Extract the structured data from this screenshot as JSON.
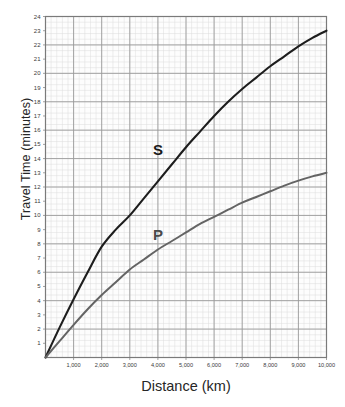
{
  "chart_data": {
    "type": "line",
    "title": "",
    "xlabel": "Distance (km)",
    "ylabel": "Travel Time (minutes)",
    "xlim": [
      0,
      10000
    ],
    "ylim": [
      0,
      24
    ],
    "grid": true,
    "grid_major_x_step": 1000,
    "grid_major_y_step": 2,
    "grid_minor_x_step": 200,
    "grid_minor_y_step": 0.4,
    "legend": "inline-labels",
    "xticks": [
      1000,
      2000,
      3000,
      4000,
      5000,
      6000,
      7000,
      8000,
      9000,
      10000
    ],
    "xticklabels": [
      "1,000",
      "2,000",
      "3,000",
      "4,000",
      "5,000",
      "6,000",
      "7,000",
      "8,000",
      "9,000",
      "10,000"
    ],
    "yticks": [
      1,
      2,
      3,
      4,
      5,
      6,
      7,
      8,
      9,
      10,
      11,
      12,
      13,
      14,
      15,
      16,
      17,
      18,
      19,
      20,
      21,
      22,
      23,
      24
    ],
    "yticklabels": [
      "1",
      "2",
      "3",
      "4",
      "5",
      "6",
      "7",
      "8",
      "9",
      "10",
      "11",
      "12",
      "13",
      "14",
      "15",
      "16",
      "17",
      "18",
      "19",
      "20",
      "21",
      "22",
      "23",
      "24"
    ],
    "annotations": [
      {
        "text": "S",
        "x": 4000,
        "y": 14.6
      },
      {
        "text": "P",
        "x": 4000,
        "y": 8.6
      }
    ],
    "series": [
      {
        "name": "S",
        "label": "S",
        "color": "#1d1d1d",
        "linewidth": 2.1,
        "x": [
          0,
          500,
          1000,
          1500,
          2000,
          2500,
          3000,
          3500,
          4000,
          4500,
          5000,
          5500,
          6000,
          6500,
          7000,
          7500,
          8000,
          8500,
          9000,
          9500,
          10000
        ],
        "y": [
          0,
          2.1,
          4.1,
          6.0,
          7.8,
          9.0,
          10.0,
          11.2,
          12.4,
          13.6,
          14.8,
          15.9,
          17.0,
          18.0,
          18.9,
          19.7,
          20.5,
          21.2,
          21.9,
          22.5,
          23.0
        ]
      },
      {
        "name": "P",
        "label": "P",
        "color": "#646464",
        "linewidth": 2.0,
        "x": [
          0,
          500,
          1000,
          1500,
          2000,
          2500,
          3000,
          3500,
          4000,
          4500,
          5000,
          5500,
          6000,
          6500,
          7000,
          7500,
          8000,
          8500,
          9000,
          9500,
          10000
        ],
        "y": [
          0,
          1.15,
          2.3,
          3.4,
          4.4,
          5.3,
          6.2,
          6.9,
          7.6,
          8.2,
          8.8,
          9.4,
          9.9,
          10.4,
          10.9,
          11.3,
          11.7,
          12.1,
          12.45,
          12.75,
          13.0
        ]
      }
    ]
  },
  "colors": {
    "s_curve": "#1d1d1d",
    "p_curve": "#646464",
    "grid_major": "#9a9a9a",
    "grid_minor": "#dcdcdc",
    "axis": "#7a7a7a",
    "background": "#ffffff",
    "plot_background": "#fdfdfd"
  }
}
